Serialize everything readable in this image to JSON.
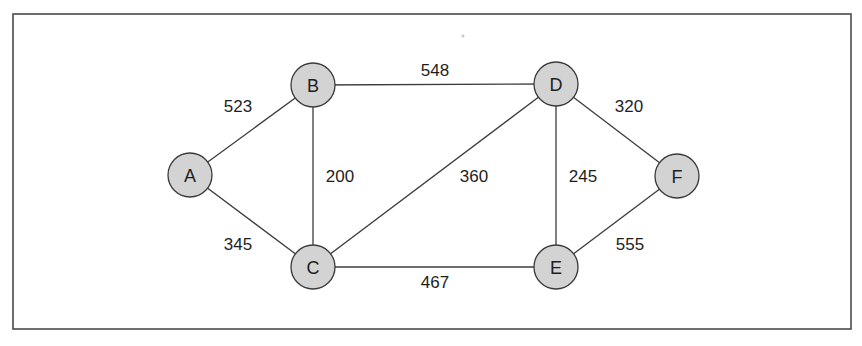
{
  "diagram": {
    "type": "weighted-undirected-graph",
    "colors": {
      "node_fill": "#d3d3d3",
      "node_stroke": "#3a3a3a",
      "edge": "#3c3c3c",
      "text": "#1e1e1e",
      "frame": "#4a4a4a"
    },
    "frame": {
      "x": 13,
      "y": 14,
      "width": 838,
      "height": 315
    },
    "node_radius": 22,
    "nodes": [
      {
        "id": "A",
        "label": "A",
        "x": 190,
        "y": 175
      },
      {
        "id": "B",
        "label": "B",
        "x": 313,
        "y": 85
      },
      {
        "id": "C",
        "label": "C",
        "x": 313,
        "y": 267
      },
      {
        "id": "D",
        "label": "D",
        "x": 556,
        "y": 84
      },
      {
        "id": "E",
        "label": "E",
        "x": 556,
        "y": 267
      },
      {
        "id": "F",
        "label": "F",
        "x": 677,
        "y": 176
      }
    ],
    "edges": [
      {
        "from": "A",
        "to": "B",
        "weight": "523",
        "label_x": 238,
        "label_y": 106
      },
      {
        "from": "A",
        "to": "C",
        "weight": "345",
        "label_x": 238,
        "label_y": 244
      },
      {
        "from": "B",
        "to": "D",
        "weight": "548",
        "label_x": 435,
        "label_y": 70
      },
      {
        "from": "B",
        "to": "C",
        "weight": "200",
        "label_x": 340,
        "label_y": 176
      },
      {
        "from": "C",
        "to": "D",
        "weight": "360",
        "label_x": 474,
        "label_y": 176
      },
      {
        "from": "C",
        "to": "E",
        "weight": "467",
        "label_x": 435,
        "label_y": 282
      },
      {
        "from": "D",
        "to": "E",
        "weight": "245",
        "label_x": 583,
        "label_y": 176
      },
      {
        "from": "D",
        "to": "F",
        "weight": "320",
        "label_x": 629,
        "label_y": 106
      },
      {
        "from": "E",
        "to": "F",
        "weight": "555",
        "label_x": 630,
        "label_y": 244
      }
    ]
  }
}
